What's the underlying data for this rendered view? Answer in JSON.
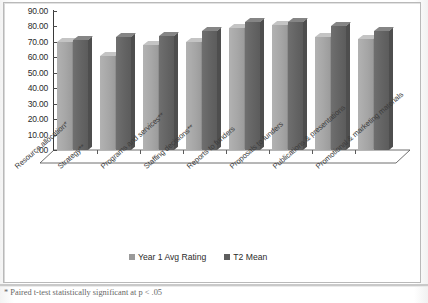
{
  "chart_data": {
    "type": "bar",
    "title": "",
    "xlabel": "",
    "ylabel": "",
    "ylim": [
      0,
      90
    ],
    "grid": false,
    "legend_position": "bottom",
    "categories": [
      "Resource allocation*",
      "Strategy**",
      "Programs and services**",
      "Staffing decisions**",
      "Reports to funders",
      "Proposals to funders",
      "Publications & presentations",
      "Promotional & marketing materials"
    ],
    "ticklabels": [
      "90.00",
      "80.00",
      "70.00",
      "60.00",
      "50.00",
      "40.00",
      "30.00",
      "20.00",
      "10.00",
      ".00"
    ],
    "tickvalues": [
      90,
      80,
      70,
      60,
      50,
      40,
      30,
      20,
      10,
      0
    ],
    "series": [
      {
        "name": "Year 1 Avg Rating",
        "color": "#a6a6a6",
        "values": [
          70.0,
          61.0,
          68.0,
          70.0,
          79.0,
          81.0,
          73.0,
          72.0
        ]
      },
      {
        "name": "T2 Mean",
        "color": "#636363",
        "values": [
          71.0,
          73.0,
          74.0,
          77.0,
          83.0,
          83.0,
          80.0,
          77.0
        ]
      }
    ],
    "annotations": [
      "* Paired t-test statistically significant at p < .05"
    ]
  },
  "legend": {
    "items": [
      {
        "label": "Year 1 Avg Rating"
      },
      {
        "label": "T2 Mean"
      }
    ]
  },
  "footnote": {
    "text": "* Paired t-test statistically significant at p < .05"
  }
}
